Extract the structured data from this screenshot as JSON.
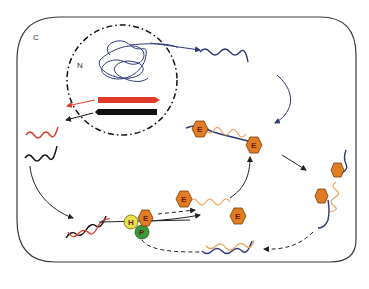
{
  "panel_label": "C",
  "compartment_label": "N",
  "nodes": {
    "hexagon_label": "E",
    "helper_H": "H",
    "helper_E": "E",
    "helper_P": "P"
  },
  "colors": {
    "frame": "#3a3a3a",
    "mRNA_blue": "#2e3a7a",
    "red_strand": "#e03a28",
    "black_strand": "#111111",
    "orange_strand": "#e8a05a",
    "hexagon_fill": "#e07c22",
    "hexagon_stroke": "#7a3a0a",
    "H_fill": "#e8e04a",
    "P_fill": "#3a9a3a"
  }
}
